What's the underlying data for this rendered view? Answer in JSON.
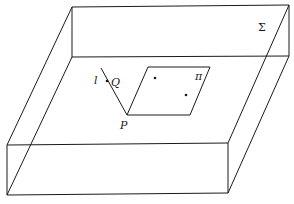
{
  "diagram": {
    "labels": {
      "region": "Σ",
      "plane": "π",
      "point_p": "P",
      "point_q": "Q",
      "line": "l"
    },
    "colors": {
      "stroke": "#1a1a1a",
      "background": "#ffffff"
    }
  }
}
